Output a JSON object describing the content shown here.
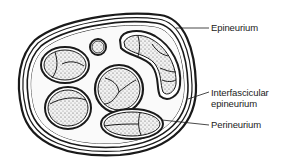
{
  "diagram": {
    "labels": {
      "epineurium": "Epineurium",
      "interfascicular_line1": "Interfascicular",
      "interfascicular_line2": "epineurium",
      "perineurium": "Perineurium"
    },
    "colors": {
      "ink": "#1a1a1a",
      "background": "#ffffff",
      "fascicle_fill": "#d8d8d8"
    }
  }
}
